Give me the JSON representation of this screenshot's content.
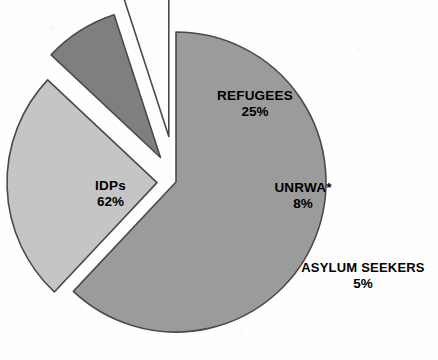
{
  "chart_data": {
    "type": "pie",
    "title": "",
    "subtitle": "",
    "xlabel": "",
    "ylabel": "",
    "legend_position": "none",
    "grid": false,
    "value_unit": "%",
    "categories": [
      "IDPs",
      "REFUGEES",
      "UNRWA*",
      "ASYLUM SEEKERS"
    ],
    "values": [
      62,
      25,
      8,
      5
    ],
    "slices": [
      {
        "label": "IDPs",
        "value": 62,
        "value_text": "62%",
        "color": "#9b9b9b",
        "stroke": "#4a4a4a",
        "exploded": false,
        "start_angle_deg": 0,
        "sweep_deg": 223.2
      },
      {
        "label": "REFUGEES",
        "value": 25,
        "value_text": "25%",
        "color": "#c5c5c5",
        "stroke": "#4a4a4a",
        "exploded": true,
        "start_angle_deg": 223.2,
        "sweep_deg": 90.0
      },
      {
        "label": "UNRWA*",
        "value": 8,
        "value_text": "8%",
        "color": "#7f7f7f",
        "stroke": "#3d3d3d",
        "exploded": true,
        "start_angle_deg": 313.2,
        "sweep_deg": 28.8
      },
      {
        "label": "ASYLUM SEEKERS",
        "value": 5,
        "value_text": "5%",
        "color": "#fdfdfd",
        "stroke": "#4a4a4a",
        "exploded": true,
        "start_angle_deg": 342.0,
        "sweep_deg": 18.0
      }
    ]
  },
  "labels": {
    "idps": {
      "name": "IDPs",
      "value": "62%"
    },
    "refugees": {
      "name": "REFUGEES",
      "value": "25%"
    },
    "unrwa": {
      "name": "UNRWA*",
      "value": "8%"
    },
    "asylum": {
      "name": "ASYLUM SEEKERS",
      "value": "5%"
    }
  },
  "colors": {
    "background": "#ffffff",
    "idps": "#9b9b9b",
    "refugees": "#c5c5c5",
    "unrwa": "#7f7f7f",
    "asylum": "#fdfdfd",
    "outline": "#4a4a4a",
    "text": "#000000"
  }
}
